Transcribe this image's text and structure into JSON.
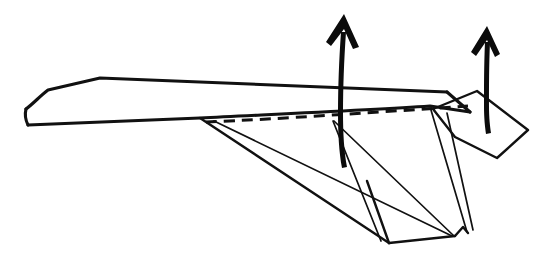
{
  "figure": {
    "kind": "line-drawing",
    "background_color": "#ffffff",
    "ink_color": "#111111",
    "title": "",
    "caption": "",
    "strokes": {
      "wing_top_edge": "Upper wing panel leading edge, nearly horizontal",
      "wing_left_tip": "Angular blunt nose at left end",
      "body_lower_edge": "Long lower body line sloping gently down to the right",
      "fold_line": "Dashed valley fold line along the body crease",
      "under_flap": "Large triangular flap hanging below the body",
      "inner_flap": "Secondary narrow triangular flap",
      "tail_flap": "Quadrilateral tail fin at the right end"
    },
    "arrows": [
      {
        "name": "center-fold-arrow",
        "direction": "up",
        "meaning": "fold upward",
        "x": 344,
        "y": 14
      },
      {
        "name": "tail-fold-arrow",
        "direction": "up",
        "meaning": "fold upward",
        "x": 487,
        "y": 26
      }
    ],
    "geometry": {
      "wing_top": "M 27,110 L 48,90 L 100,79 L 447,93",
      "wing_nose": "M 27,110 L 29,124",
      "body_lower": "M 29,124 L 200,118 L 430,107 L 470,113",
      "wing_right_edge": "M 447,93 L 470,113",
      "fold_dash": "M 205,122 L 468,106",
      "flap_a": "M 200,118 L 388,243 L 455,237",
      "flap_b": "M 213,121 L 452,236",
      "flap_c": "M 333,122 L 380,241",
      "flap_d": "M 333,122 L 455,236",
      "flap_e": "M 368,181 L 388,243",
      "tail_left": "M 432,110 L 468,233",
      "tail_right": "M 447,112 L 473,231",
      "tail_notch": "M 455,236 L 462,228 L 468,233",
      "tail_fin": "M 434,109 L 478,92 L 528,130 L 498,158 L 455,138 Z"
    }
  }
}
